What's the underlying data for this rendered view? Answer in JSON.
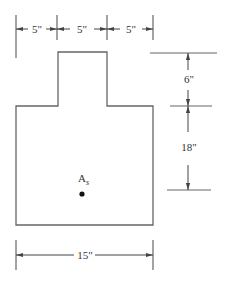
{
  "diagram": {
    "type": "T-section cross-section (inverted, concrete beam)",
    "colors": {
      "line": "#555555",
      "text": "#333333",
      "dot": "#111111",
      "background": "#ffffff"
    },
    "top_dimensions": [
      {
        "label": "5\""
      },
      {
        "label": "5\""
      },
      {
        "label": "5\""
      }
    ],
    "right_dimensions": [
      {
        "label": "6\""
      },
      {
        "label": "18\""
      }
    ],
    "bottom_dimension": {
      "label": "15\""
    },
    "steel_label": {
      "main": "A",
      "subscript": "s"
    }
  }
}
